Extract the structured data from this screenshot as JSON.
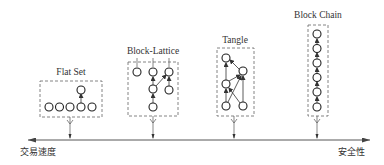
{
  "diagram": {
    "type": "spectrum-comparison",
    "axis": {
      "left_label": "交易速度",
      "right_label": "安全性",
      "direction": "bidirectional"
    },
    "structures": [
      {
        "id": "flat-set",
        "title": "Flat Set",
        "nodes": [
          [
            49,
            107
          ],
          [
            59,
            107
          ],
          [
            70,
            107
          ],
          [
            81,
            107
          ],
          [
            92,
            107
          ],
          [
            81,
            90
          ]
        ],
        "edges": [
          [
            5,
            3
          ]
        ]
      },
      {
        "id": "block-lattice",
        "title": "Block-Lattice",
        "nodes": [
          [
            137,
            72
          ],
          [
            153,
            72
          ],
          [
            169,
            72
          ],
          [
            153,
            89
          ],
          [
            169,
            90
          ],
          [
            153,
            107
          ]
        ],
        "edges": [
          [
            3,
            1
          ],
          [
            5,
            3
          ],
          [
            3,
            2
          ],
          [
            4,
            2
          ]
        ]
      },
      {
        "id": "tangle",
        "title": "Tangle",
        "nodes": [
          [
            226,
            58
          ],
          [
            243,
            71
          ],
          [
            226,
            84
          ],
          [
            226,
            106
          ],
          [
            243,
            106
          ]
        ],
        "edges": [
          [
            2,
            0
          ],
          [
            1,
            0
          ],
          [
            2,
            1
          ],
          [
            3,
            2
          ],
          [
            3,
            1
          ],
          [
            4,
            2
          ],
          [
            4,
            1
          ]
        ]
      },
      {
        "id": "block-chain",
        "title": "Block Chain",
        "nodes": [
          [
            317,
            34
          ],
          [
            317,
            48
          ],
          [
            317,
            63
          ],
          [
            317,
            77
          ],
          [
            317,
            92
          ],
          [
            317,
            107
          ]
        ],
        "edges": [
          [
            1,
            0
          ],
          [
            2,
            1
          ],
          [
            3,
            2
          ],
          [
            4,
            3
          ],
          [
            5,
            4
          ]
        ]
      }
    ]
  }
}
